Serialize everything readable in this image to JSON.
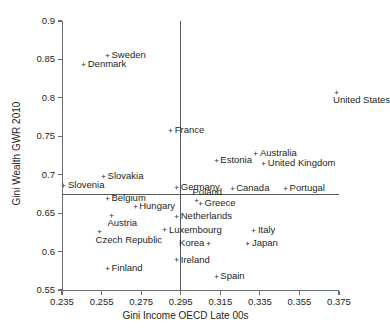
{
  "chart_data": {
    "type": "scatter",
    "title": "",
    "xlabel": "Gini Income OECD Late 00s",
    "ylabel": "Gini Wealth GWR 2010",
    "xlim": [
      0.235,
      0.375
    ],
    "ylim": [
      0.55,
      0.9
    ],
    "xticks": [
      "0.235",
      "0.255",
      "0.275",
      "0.295",
      "0.315",
      "0.335",
      "0.355",
      "0.375"
    ],
    "yticks": [
      "0.55",
      "0.6",
      "0.65",
      "0.7",
      "0.75",
      "0.8",
      "0.85",
      "0.9"
    ],
    "grid": false,
    "legend": "none",
    "marker_color": "#6d6e71",
    "axis_color": "#6d6e71",
    "reference_lines": [
      {
        "orientation": "vertical",
        "value": 0.295,
        "axis": "x"
      },
      {
        "orientation": "horizontal",
        "value": 0.668,
        "axis": "y"
      }
    ],
    "points": [
      {
        "label": "Sweden",
        "x": 0.258,
        "y": 0.855,
        "label_pos": "right"
      },
      {
        "label": "Denmark",
        "x": 0.246,
        "y": 0.843,
        "label_pos": "right"
      },
      {
        "label": "United States",
        "x": 0.374,
        "y": 0.807,
        "label_pos": "below"
      },
      {
        "label": "France",
        "x": 0.29,
        "y": 0.757,
        "label_pos": "right"
      },
      {
        "label": "Australia",
        "x": 0.333,
        "y": 0.727,
        "label_pos": "right"
      },
      {
        "label": "United Kingdom",
        "x": 0.337,
        "y": 0.715,
        "label_pos": "right"
      },
      {
        "label": "Estonia",
        "x": 0.313,
        "y": 0.718,
        "label_pos": "right"
      },
      {
        "label": "Slovakia",
        "x": 0.256,
        "y": 0.698,
        "label_pos": "right"
      },
      {
        "label": "Slovenia",
        "x": 0.236,
        "y": 0.686,
        "label_pos": "right"
      },
      {
        "label": "Germany",
        "x": 0.293,
        "y": 0.683,
        "label_pos": "right"
      },
      {
        "label": "Canada",
        "x": 0.321,
        "y": 0.682,
        "label_pos": "right"
      },
      {
        "label": "Portugal",
        "x": 0.348,
        "y": 0.682,
        "label_pos": "right"
      },
      {
        "label": "Belgium",
        "x": 0.258,
        "y": 0.669,
        "label_pos": "right"
      },
      {
        "label": "Poland",
        "x": 0.303,
        "y": 0.666,
        "label_pos": "above"
      },
      {
        "label": "Greece",
        "x": 0.305,
        "y": 0.662,
        "label_pos": "right"
      },
      {
        "label": "Hungary",
        "x": 0.272,
        "y": 0.659,
        "label_pos": "right"
      },
      {
        "label": "Austria",
        "x": 0.26,
        "y": 0.647,
        "label_pos": "below"
      },
      {
        "label": "Netherlands",
        "x": 0.293,
        "y": 0.646,
        "label_pos": "right"
      },
      {
        "label": "Luxembourg",
        "x": 0.287,
        "y": 0.628,
        "label_pos": "right"
      },
      {
        "label": "Italy",
        "x": 0.332,
        "y": 0.627,
        "label_pos": "right"
      },
      {
        "label": "Czech Republic",
        "x": 0.254,
        "y": 0.626,
        "label_pos": "below"
      },
      {
        "label": "Korea",
        "x": 0.309,
        "y": 0.611,
        "label_pos": "left"
      },
      {
        "label": "Japan",
        "x": 0.329,
        "y": 0.611,
        "label_pos": "right"
      },
      {
        "label": "Ireland",
        "x": 0.293,
        "y": 0.589,
        "label_pos": "right"
      },
      {
        "label": "Finland",
        "x": 0.258,
        "y": 0.578,
        "label_pos": "right"
      },
      {
        "label": "Spain",
        "x": 0.313,
        "y": 0.568,
        "label_pos": "right"
      }
    ]
  },
  "caption": {
    "text": ""
  }
}
